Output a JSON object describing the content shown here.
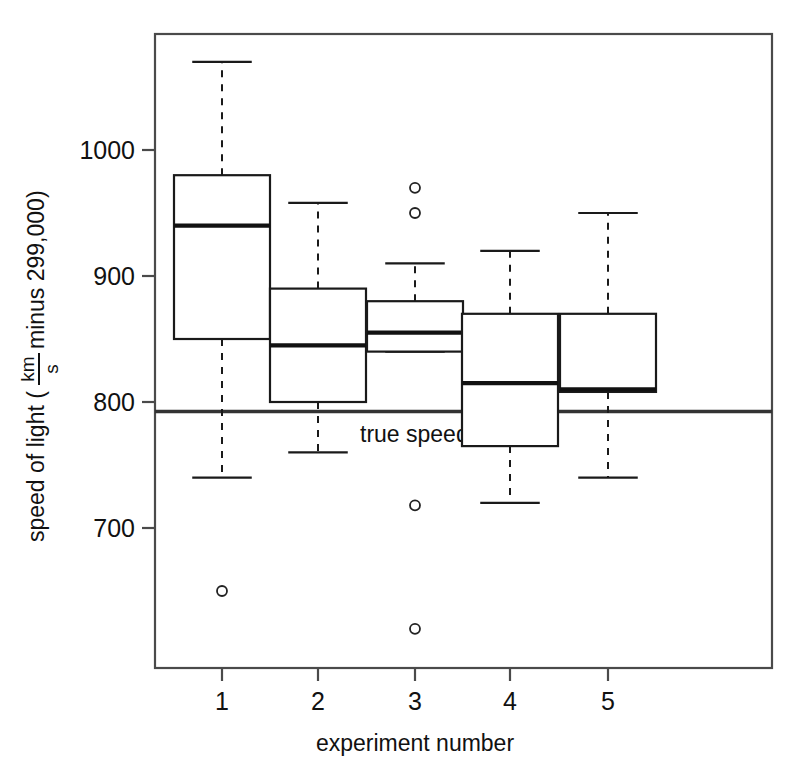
{
  "chart_data": {
    "type": "box",
    "title": "",
    "xlabel": "experiment number",
    "ylabel_parts": {
      "prefix": "speed of light (",
      "frac_numerator": "km",
      "frac_denominator": "s",
      "suffix": " minus 299,000)"
    },
    "ylabel": "speed of light ( km / s  minus 299,000)",
    "categories": [
      "1",
      "2",
      "3",
      "4",
      "5"
    ],
    "xticklabels": [
      "1",
      "2",
      "3",
      "4",
      "5"
    ],
    "yticklabels": [
      "1000",
      "900",
      "800",
      "700"
    ],
    "ytickvalues": [
      1000,
      900,
      800,
      700
    ],
    "ylim": [
      610,
      1085
    ],
    "xlim": [
      0.4,
      5.6
    ],
    "grid": false,
    "legend": false,
    "annotations": [
      {
        "name": "true-speed-line",
        "label": "true speed",
        "value": 792.5,
        "style": "horizontal-reference-line",
        "color": "#333333"
      }
    ],
    "boxes": [
      {
        "category": "1",
        "whisker_low": 740,
        "q1": 850,
        "median": 940,
        "q3": 980,
        "whisker_high": 1070,
        "outliers": [
          650
        ]
      },
      {
        "category": "2",
        "whisker_low": 760,
        "q1": 800,
        "median": 845,
        "q3": 890,
        "whisker_high": 958,
        "outliers": []
      },
      {
        "category": "3",
        "whisker_low": 840,
        "q1": 840,
        "median": 855,
        "q3": 880,
        "whisker_high": 910,
        "outliers": [
          970,
          950,
          718,
          620
        ]
      },
      {
        "category": "4",
        "whisker_low": 720,
        "q1": 765,
        "median": 815,
        "q3": 870,
        "whisker_high": 920,
        "outliers": []
      },
      {
        "category": "5",
        "whisker_low": 740,
        "q1": 808,
        "median": 810,
        "q3": 870,
        "whisker_high": 950,
        "outliers": []
      }
    ],
    "colors": {
      "box_stroke": "#1a1a1a",
      "box_fill": "#ffffff",
      "median_stroke": "#111111",
      "whisker_stroke": "#1a1a1a",
      "frame_stroke": "#4a4a4a",
      "outlier_stroke": "#222222",
      "reference_line": "#333333",
      "background": "#ffffff"
    }
  }
}
